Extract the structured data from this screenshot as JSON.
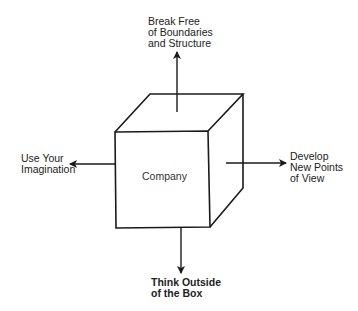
{
  "diagram": {
    "center_label": "Company",
    "labels": {
      "top": [
        "Break Free",
        "of Boundaries",
        "and Structure"
      ],
      "left": [
        "Use Your",
        "Imagination"
      ],
      "right": [
        "Develop",
        "New Points",
        "of View"
      ],
      "bottom": [
        "Think Outside",
        "of the Box"
      ]
    },
    "colors": {
      "stroke": "#1a1a1a",
      "background": "#ffffff"
    }
  }
}
